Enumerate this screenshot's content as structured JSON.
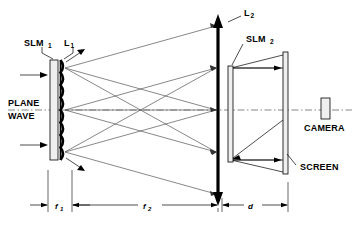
{
  "figure": {
    "type": "optical-system-diagram",
    "background_color": "#ffffff",
    "ink_color": "#000000",
    "ray_color": "#555555"
  },
  "labels": {
    "slm1": {
      "base": "SLM",
      "sub": "1"
    },
    "lens1": {
      "base": "L",
      "sub": "1"
    },
    "lens2": {
      "base": "L",
      "sub": "2"
    },
    "slm2": {
      "base": "SLM",
      "sub": "2"
    },
    "plane_wave_line1": "PLANE",
    "plane_wave_line2": "WAVE",
    "camera": "CAMERA",
    "screen": "SCREEN"
  },
  "dimensions": [
    {
      "id": "f1",
      "base": "f",
      "sub": "1",
      "x_start": 48,
      "x_end": 72,
      "y": 205
    },
    {
      "id": "f2",
      "base": "f",
      "sub": "2",
      "x_start": 72,
      "x_end": 218,
      "y": 205
    },
    {
      "id": "d",
      "base": "d",
      "sub": "",
      "x_start": 222,
      "x_end": 288,
      "y": 205
    }
  ],
  "components": [
    {
      "name": "slm1-panel",
      "kind": "rectangle",
      "x": 50,
      "y": 60,
      "w": 8,
      "h": 100
    },
    {
      "name": "lenslet-array-l1",
      "kind": "scalloped-column",
      "x": 60,
      "y": 60,
      "w": 5,
      "h": 100,
      "count": 8
    },
    {
      "name": "lens-l2",
      "kind": "double-arrow",
      "x": 218,
      "y": 18,
      "h": 182
    },
    {
      "name": "slm2-panel",
      "kind": "rectangle",
      "x": 228,
      "y": 66,
      "w": 5,
      "h": 96
    },
    {
      "name": "screen-panel",
      "kind": "rectangle",
      "x": 283,
      "y": 52,
      "w": 5,
      "h": 122
    },
    {
      "name": "camera-body",
      "kind": "rectangle",
      "x": 321,
      "y": 97,
      "w": 9,
      "h": 20
    }
  ],
  "optical_axis": {
    "y": 110,
    "x_start": 8,
    "x_end": 352,
    "style": "dash-dot"
  },
  "ray_origins_l1": [
    68,
    110,
    152
  ],
  "ray_targets_l2": [
    26,
    68,
    110,
    152,
    194
  ],
  "plane_wave_arrows": [
    {
      "y": 75,
      "x_start": 20,
      "x_end": 48
    },
    {
      "y": 145,
      "x_start": 20,
      "x_end": 48
    }
  ]
}
